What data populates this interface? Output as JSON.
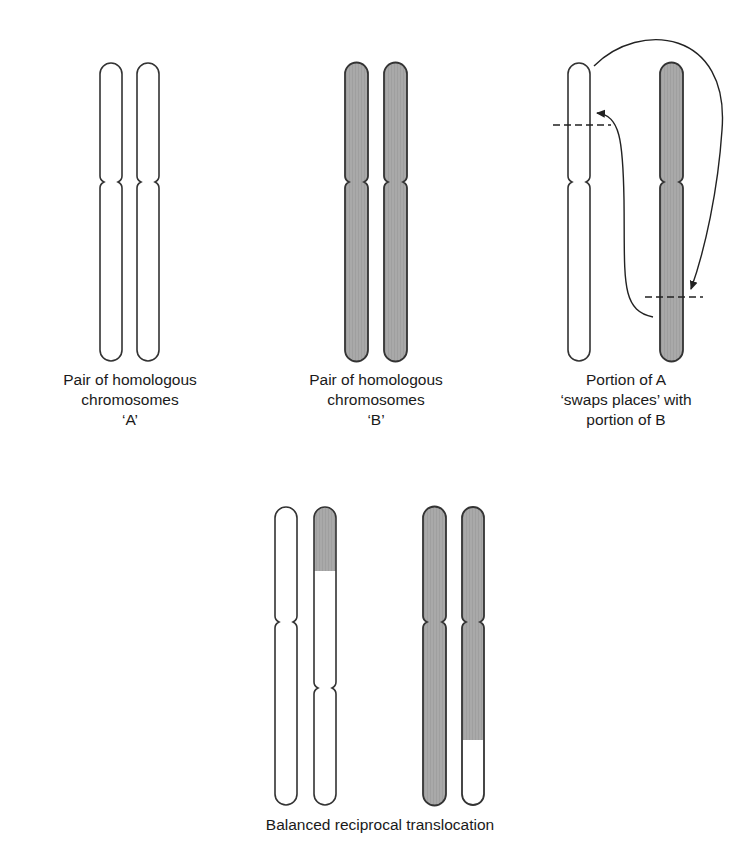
{
  "colors": {
    "outline": "#333333",
    "shaded": "#a8a8a8",
    "unshaded": "#ffffff",
    "arrow": "#222222"
  },
  "panels": [
    {
      "id": "pair-a",
      "caption": [
        "Pair of homologous",
        "chromosomes",
        "‘A’"
      ]
    },
    {
      "id": "pair-b",
      "caption": [
        "Pair of homologous",
        "chromosomes",
        "‘B’"
      ]
    },
    {
      "id": "swap",
      "caption": [
        "Portion of A",
        "‘swaps places’ with",
        "portion of B"
      ]
    },
    {
      "id": "result",
      "caption": [
        "Balanced reciprocal translocation"
      ]
    }
  ]
}
